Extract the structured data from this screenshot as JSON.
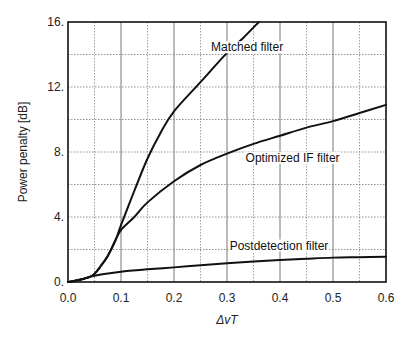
{
  "chart_data": {
    "type": "line",
    "title": "",
    "xlabel": "ΔvT",
    "ylabel": "Power penalty [dB]",
    "xlim": [
      0,
      0.6
    ],
    "ylim": [
      0,
      16
    ],
    "x_ticks": [
      0.0,
      0.1,
      0.2,
      0.3,
      0.4,
      0.5,
      0.6
    ],
    "x_tick_labels": [
      "0.0",
      "0.1",
      "0.2",
      "0.3",
      "0.4",
      "0.5",
      "0.6"
    ],
    "y_ticks": [
      0,
      4,
      8,
      12,
      16
    ],
    "y_tick_labels": [
      "0.",
      "4.",
      "8.",
      "12.",
      "16."
    ],
    "grid": {
      "x_major": 0.1,
      "x_minor": 0.05,
      "y_step": 2
    },
    "series": [
      {
        "name": "Matched filter",
        "x": [
          0.0,
          0.02,
          0.04,
          0.05,
          0.06,
          0.075,
          0.09,
          0.1,
          0.125,
          0.15,
          0.175,
          0.2,
          0.25,
          0.3,
          0.33,
          0.36
        ],
        "values": [
          0.0,
          0.12,
          0.3,
          0.5,
          0.9,
          1.6,
          2.6,
          3.5,
          5.6,
          7.6,
          9.2,
          10.5,
          12.3,
          14.1,
          15.0,
          16.0
        ],
        "label_pos": {
          "x": 0.27,
          "y": 14.2
        }
      },
      {
        "name": "Optimized IF filter",
        "x": [
          0.0,
          0.02,
          0.04,
          0.05,
          0.06,
          0.075,
          0.09,
          0.1,
          0.125,
          0.15,
          0.2,
          0.25,
          0.3,
          0.35,
          0.4,
          0.45,
          0.5,
          0.55,
          0.6
        ],
        "values": [
          0.0,
          0.12,
          0.3,
          0.5,
          0.9,
          1.6,
          2.6,
          3.2,
          4.0,
          4.9,
          6.2,
          7.2,
          7.9,
          8.5,
          9.0,
          9.5,
          9.9,
          10.4,
          10.9
        ],
        "label_pos": {
          "x": 0.335,
          "y": 7.4
        }
      },
      {
        "name": "Postdetection filter",
        "x": [
          0.0,
          0.02,
          0.04,
          0.05,
          0.075,
          0.1,
          0.15,
          0.2,
          0.25,
          0.3,
          0.35,
          0.4,
          0.45,
          0.5,
          0.55,
          0.6
        ],
        "values": [
          0.0,
          0.12,
          0.3,
          0.38,
          0.52,
          0.63,
          0.78,
          0.9,
          1.03,
          1.15,
          1.26,
          1.35,
          1.43,
          1.5,
          1.53,
          1.56
        ],
        "label_pos": {
          "x": 0.305,
          "y": 2.0
        }
      }
    ]
  }
}
